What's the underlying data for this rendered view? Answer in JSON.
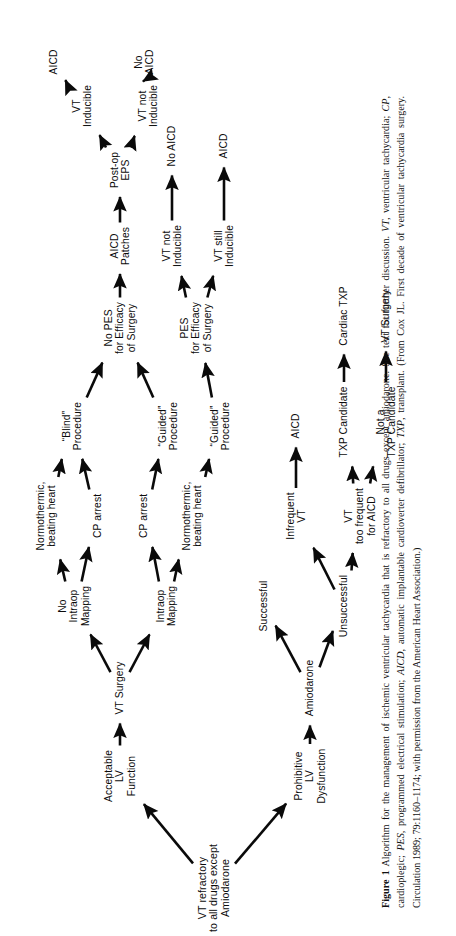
{
  "figure": {
    "label": "Figure 1",
    "caption_segments": [
      {
        "style": "bold",
        "text": "Figure 1"
      },
      {
        "style": "plain",
        "text": "  Algorithm for the management of ischemic ventricular tachycardia that is refractory to all drugs except amiodarone. See text for further discussion. "
      },
      {
        "style": "italic",
        "text": "VT"
      },
      {
        "style": "plain",
        "text": ", ventricular tachycardia; "
      },
      {
        "style": "italic",
        "text": "CP"
      },
      {
        "style": "plain",
        "text": ", cardioplegic; "
      },
      {
        "style": "italic",
        "text": "PES"
      },
      {
        "style": "plain",
        "text": ", programmed electrical stimulation; "
      },
      {
        "style": "italic",
        "text": "AICD"
      },
      {
        "style": "plain",
        "text": ", automatic implantable cardioverter defibrillator; "
      },
      {
        "style": "italic",
        "text": "TXP"
      },
      {
        "style": "plain",
        "text": ", transplant. (From Cox JL. First decade of ventricular tachycardia surgery. Circulation 1989; 79:1160–1174; with permission from the American Heart Association.)"
      }
    ],
    "caption_plain": "Figure 1  Algorithm for the management of ischemic ventricular tachycardia that is refractory to all drugs except amiodarone. See text for further discussion. VT, ventricular tachycardia; CP, cardioplegic; PES, programmed electrical stimulation; AICD, automatic implantable cardioverter defibrillator; TXP, transplant. (From Cox JL. First decade of ventricular tachycardia surgery. Circulation 1989; 79:1160–1174; with permission from the American Heart Association.)"
  },
  "chart_data": {
    "type": "diagram",
    "diagram_kind": "clinical decision tree / flowchart",
    "orientation": "rotated 90° counter-clockwise on page; flow reads left-to-right in diagram space",
    "nodes": [
      {
        "id": "root",
        "text": "VT refractory\nto all drugs except\nAmiodarone",
        "x": 58,
        "y": 190
      },
      {
        "id": "acceptlv",
        "text": "Acceptable\nLV\nFunction",
        "x": 170,
        "y": 96
      },
      {
        "id": "prohiblv",
        "text": "Prohibitive\nLV\nDysfunction",
        "x": 170,
        "y": 286
      },
      {
        "id": "vtsurg",
        "text": "VT Surgery",
        "x": 258,
        "y": 96
      },
      {
        "id": "amio",
        "text": "Amiodarone",
        "x": 258,
        "y": 286
      },
      {
        "id": "nomap",
        "text": "No\nIntraop\nMapping",
        "x": 340,
        "y": 50
      },
      {
        "id": "intramap",
        "text": "Intraop\nMapping",
        "x": 340,
        "y": 142
      },
      {
        "id": "success",
        "text": "Successful",
        "x": 340,
        "y": 240
      },
      {
        "id": "unsuccess",
        "text": "Unsuccessful",
        "x": 340,
        "y": 320
      },
      {
        "id": "normo1",
        "text": "Normothermic,\nbeating heart",
        "x": 430,
        "y": 22
      },
      {
        "id": "cp1",
        "text": "CP arrest",
        "x": 430,
        "y": 74
      },
      {
        "id": "cp2",
        "text": "CP arrest",
        "x": 430,
        "y": 120
      },
      {
        "id": "normo2",
        "text": "Normothermic,\nbeating heart",
        "x": 430,
        "y": 168
      },
      {
        "id": "infreq",
        "text": "Infrequent\nVT",
        "x": 430,
        "y": 272
      },
      {
        "id": "toofreq",
        "text": "VT\ntoo frequent\nfor AICD",
        "x": 430,
        "y": 336
      },
      {
        "id": "blind",
        "text": "“Blind”\nProcedure",
        "x": 520,
        "y": 48
      },
      {
        "id": "guided1",
        "text": "“Guided”\nProcedure",
        "x": 520,
        "y": 144
      },
      {
        "id": "guided2",
        "text": "“Guided”\nProcedure",
        "x": 520,
        "y": 196
      },
      {
        "id": "aicd_inf",
        "text": "AICD",
        "x": 520,
        "y": 272
      },
      {
        "id": "txpcand",
        "text": "TXP Candidate",
        "x": 524,
        "y": 320
      },
      {
        "id": "nottxp",
        "text": "Not a\nTXP Candidate",
        "x": 524,
        "y": 362
      },
      {
        "id": "nopes",
        "text": "No PES\nfor Efficacy\nof Surgery",
        "x": 618,
        "y": 96
      },
      {
        "id": "pes",
        "text": "PES\nfor Efficacy\nof Surgery",
        "x": 618,
        "y": 172
      },
      {
        "id": "cardtxp",
        "text": "Cardiac TXP",
        "x": 630,
        "y": 320
      },
      {
        "id": "vtsurg2",
        "text": "VT Surgery",
        "x": 630,
        "y": 362
      },
      {
        "id": "patches",
        "text": "AICD\nPatches",
        "x": 700,
        "y": 96
      },
      {
        "id": "vtnotind2",
        "text": "VT not\nInducible",
        "x": 700,
        "y": 148
      },
      {
        "id": "vtstill",
        "text": "VT still\nInducible",
        "x": 700,
        "y": 200
      },
      {
        "id": "posteps",
        "text": "Post-op\nEPS",
        "x": 776,
        "y": 96
      },
      {
        "id": "noaicd2",
        "text": "No AICD",
        "x": 800,
        "y": 148
      },
      {
        "id": "aicd3",
        "text": "AICD",
        "x": 800,
        "y": 200
      },
      {
        "id": "vtind",
        "text": "VT\nInducible",
        "x": 840,
        "y": 58
      },
      {
        "id": "vtnotind",
        "text": "VT not\nInducible",
        "x": 840,
        "y": 124
      },
      {
        "id": "aicd1",
        "text": "AICD",
        "x": 884,
        "y": 30
      },
      {
        "id": "noaicd1",
        "text": "No\nAICD",
        "x": 884,
        "y": 120
      }
    ],
    "edges": [
      [
        "root",
        "acceptlv"
      ],
      [
        "root",
        "prohiblv"
      ],
      [
        "acceptlv",
        "vtsurg"
      ],
      [
        "prohiblv",
        "amio"
      ],
      [
        "vtsurg",
        "nomap"
      ],
      [
        "vtsurg",
        "intramap"
      ],
      [
        "amio",
        "success"
      ],
      [
        "amio",
        "unsuccess"
      ],
      [
        "nomap",
        "normo1"
      ],
      [
        "nomap",
        "cp1"
      ],
      [
        "intramap",
        "cp2"
      ],
      [
        "intramap",
        "normo2"
      ],
      [
        "unsuccess",
        "infreq"
      ],
      [
        "unsuccess",
        "toofreq"
      ],
      [
        "normo1",
        "blind"
      ],
      [
        "cp1",
        "blind"
      ],
      [
        "cp2",
        "guided1"
      ],
      [
        "normo2",
        "guided2"
      ],
      [
        "infreq",
        "aicd_inf"
      ],
      [
        "toofreq",
        "txpcand"
      ],
      [
        "toofreq",
        "nottxp"
      ],
      [
        "blind",
        "nopes"
      ],
      [
        "guided1",
        "nopes"
      ],
      [
        "guided2",
        "pes"
      ],
      [
        "txpcand",
        "cardtxp"
      ],
      [
        "nottxp",
        "vtsurg2"
      ],
      [
        "nopes",
        "patches"
      ],
      [
        "pes",
        "vtnotind2"
      ],
      [
        "pes",
        "vtstill"
      ],
      [
        "patches",
        "posteps"
      ],
      [
        "vtnotind2",
        "noaicd2"
      ],
      [
        "vtstill",
        "aicd3"
      ],
      [
        "posteps",
        "vtind"
      ],
      [
        "posteps",
        "vtnotind"
      ],
      [
        "vtind",
        "aicd1"
      ],
      [
        "vtnotind",
        "noaicd1"
      ]
    ],
    "terminal_outcomes": [
      "AICD",
      "No AICD",
      "No AICD",
      "AICD",
      "Cardiac TXP",
      "VT Surgery",
      "AICD"
    ],
    "abbreviations": {
      "VT": "ventricular tachycardia",
      "CP": "cardioplegic",
      "PES": "programmed electrical stimulation",
      "EPS": "electrophysiologic study",
      "AICD": "automatic implantable cardioverter defibrillator",
      "TXP": "transplant",
      "LV": "left ventricular"
    },
    "source_citation": "Cox JL. First decade of ventricular tachycardia surgery. Circulation 1989; 79:1160–1174",
    "colors": {
      "ink": "#0a0a0a",
      "background": "#ffffff"
    }
  }
}
